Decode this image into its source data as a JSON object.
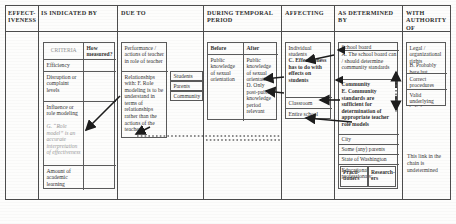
{
  "headers": [
    {
      "id": "effectiveness",
      "label": "EFFECT-IVENESS"
    },
    {
      "id": "is-indicated-by",
      "label": "IS INDICATED BY"
    },
    {
      "id": "due-to",
      "label": "DUE TO"
    },
    {
      "id": "during-temporal-period",
      "label": "DURING TEMPORAL PERIOD"
    },
    {
      "id": "affecting",
      "label": "AFFECTING"
    },
    {
      "id": "as-determined-by",
      "label": "AS DETERMINED BY"
    },
    {
      "id": "with-authority-of",
      "label": "WITH AUTHORITY OF"
    }
  ],
  "indicated_by": {
    "col_headers": {
      "criteria": "CRITERIA",
      "how_measured": "How measured?"
    },
    "rows": [
      {
        "criteria": "Efficiency",
        "how_measured": ""
      },
      {
        "criteria": "Disruption or complaint levels",
        "how_measured": ""
      },
      {
        "criteria": "Influence or role modeling",
        "annotation": "G. “Role model” is an accurate interpretation of effectiveness",
        "how_measured": ""
      },
      {
        "criteria": "Amount of academic learning",
        "how_measured": ""
      }
    ]
  },
  "due_to": {
    "rows": [
      {
        "text": "Performance / actions of teacher in role of teacher"
      },
      {
        "text": "Relationships with: F. Role modeling is to be understand in terms of relationships rather than the actions of the teacher"
      }
    ],
    "relationship_targets": [
      "Students",
      "Parents",
      "Community"
    ]
  },
  "temporal": {
    "col_headers": {
      "before": "Before",
      "after": "After"
    },
    "before": "Public knowledge of sexual orientation",
    "after": "Public knowledge of sexual orientation",
    "after_note": "D. Only post-public knowledge period relevant"
  },
  "affecting": {
    "rows": [
      {
        "text": "Individual students",
        "annotation": "C. Effectiveness has to do with effects on students"
      },
      {
        "text": "Classroom"
      },
      {
        "text": "Entire school"
      }
    ]
  },
  "as_determined_by": {
    "rows": [
      {
        "text": "School board",
        "annotation": "A. The school board can / should determine community standards"
      },
      {
        "text": "Community",
        "annotation": "E. Community standards are sufficient for determination of appropriate teacher role models",
        "bold": true
      },
      {
        "text": "City"
      },
      {
        "text": "Some (any) parents"
      },
      {
        "text": "State of Washington"
      },
      {
        "text": "Educational professionals:"
      }
    ],
    "professionals": [
      "Practi-tioners",
      "Research-ers"
    ]
  },
  "authority": {
    "rows": [
      {
        "text": "Legal / organizational rights",
        "annotation": "B. Probably here but"
      },
      {
        "text": "Correct procedures"
      },
      {
        "text": "Valid underlying beliefs"
      }
    ],
    "footnote": "This link in the chain is undetermined"
  },
  "colors": {
    "ink": "#333333",
    "rule": "#4d4d4d",
    "faded": "#9a9a9a",
    "paper": "#fdfdfc"
  }
}
